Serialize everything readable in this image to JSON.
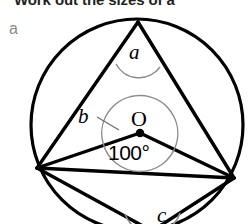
{
  "question": {
    "prompt": "Work out the sizes of a",
    "part_label": "a"
  },
  "figure": {
    "name": "circle-theorem-diagram",
    "center_label": "O",
    "angle_labels": {
      "a": "a",
      "b": "b",
      "c": "c"
    },
    "known_angle": "100°",
    "colors": {
      "stroke": "#000000",
      "arc_marker": "#8c8c8c",
      "background": "#ffffff",
      "part_label": "#8a8a8a"
    },
    "geometry": {
      "circle": {
        "cx": 137,
        "cy": 125,
        "r": 106
      },
      "center_point": {
        "x": 140,
        "y": 133
      },
      "vertices": {
        "top": {
          "x": 138,
          "y": 22
        },
        "left": {
          "x": 37,
          "y": 168
        },
        "right": {
          "x": 234,
          "y": 178
        },
        "bottom": {
          "x": 150,
          "y": 229
        }
      }
    }
  }
}
